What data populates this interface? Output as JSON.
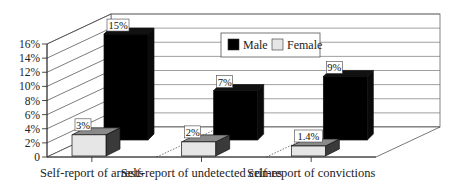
{
  "chart_data": {
    "type": "bar",
    "title": "",
    "xlabel": "",
    "ylabel": "",
    "categories": [
      "Self-report of arrests",
      "Self-report of undetected crimes",
      "Self-report of convictions"
    ],
    "series": [
      {
        "name": "Male",
        "values": [
          15,
          7,
          9
        ],
        "labels": [
          "15%",
          "7%",
          "9%"
        ],
        "color": "#000000"
      },
      {
        "name": "Female",
        "values": [
          3,
          2,
          1.4
        ],
        "labels": [
          "3%",
          "2%",
          "1.4%"
        ],
        "color": "#e6e6e6"
      }
    ],
    "ylim": [
      0,
      16
    ],
    "yticks": [
      0,
      2,
      4,
      6,
      8,
      10,
      12,
      14,
      16
    ],
    "ytick_labels": [
      "0",
      "2%",
      "4%",
      "6%",
      "8%",
      "10%",
      "12%",
      "14%",
      "16%"
    ],
    "grid": true,
    "legend_position": "upper-center",
    "style": "3d"
  },
  "legend": {
    "items": [
      {
        "label": "Male",
        "color": "#000000"
      },
      {
        "label": "Female",
        "color": "#e6e6e6"
      }
    ]
  }
}
